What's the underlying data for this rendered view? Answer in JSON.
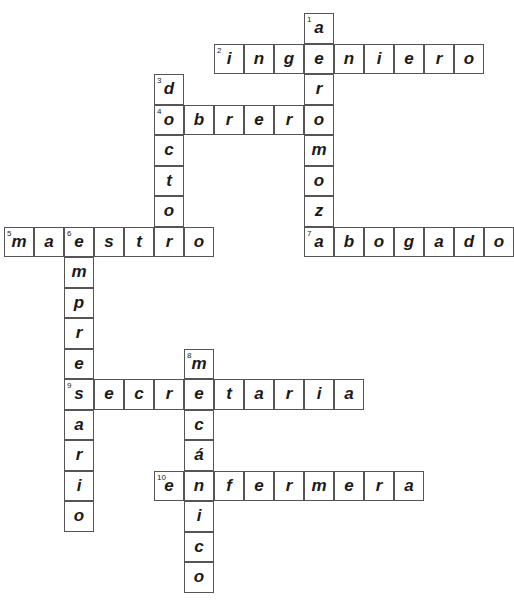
{
  "puzzle": {
    "type": "crossword",
    "cell_size": [
      30,
      30.5
    ],
    "words": [
      {
        "number": 1,
        "direction": "down",
        "word": "aeromozo",
        "row": 0,
        "col": 10
      },
      {
        "number": 2,
        "direction": "across",
        "word": "ingeniero",
        "row": 1,
        "col": 7
      },
      {
        "number": 3,
        "direction": "down",
        "word": "doctor",
        "row": 2,
        "col": 5
      },
      {
        "number": 4,
        "direction": "across",
        "word": "obrero",
        "row": 3,
        "col": 5
      },
      {
        "number": 5,
        "direction": "across",
        "word": "maestro",
        "row": 7,
        "col": 0
      },
      {
        "number": 6,
        "direction": "down",
        "word": "empresario",
        "row": 7,
        "col": 2
      },
      {
        "number": 7,
        "direction": "across",
        "word": "abogado",
        "row": 7,
        "col": 10
      },
      {
        "number": 8,
        "direction": "down",
        "word": "mecánico",
        "row": 11,
        "col": 6
      },
      {
        "number": 9,
        "direction": "across",
        "word": "secretaria",
        "row": 12,
        "col": 2
      },
      {
        "number": 10,
        "direction": "across",
        "word": "enfermera",
        "row": 15,
        "col": 5
      }
    ]
  }
}
